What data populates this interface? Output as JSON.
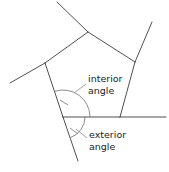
{
  "diagram": {
    "type": "geometry-figure",
    "background_color": "#ffffff",
    "line_color": "#3b3b3b",
    "arc_color": "#6f6f6f",
    "text_color": "#1b1b1b",
    "labels": {
      "interior": {
        "line1": "interior",
        "line2": "angle"
      },
      "exterior": {
        "line1": "exterior",
        "line2": "angle"
      }
    },
    "vertices": {
      "top": [
        88,
        32
      ],
      "upper_left": [
        45,
        63
      ],
      "upper_right": [
        135,
        62
      ],
      "lower_left": [
        63,
        117
      ],
      "lower_right": [
        120,
        117
      ]
    },
    "edges": [
      {
        "name": "top-left-edge",
        "from": [
          45,
          63
        ],
        "to": [
          88,
          32
        ]
      },
      {
        "name": "top-right-edge",
        "from": [
          88,
          32
        ],
        "to": [
          135,
          62
        ]
      },
      {
        "name": "right-edge",
        "from": [
          135,
          62
        ],
        "to": [
          120,
          117
        ]
      },
      {
        "name": "bottom-edge",
        "from": [
          120,
          117
        ],
        "to": [
          63,
          117
        ]
      },
      {
        "name": "left-edge",
        "from": [
          63,
          117
        ],
        "to": [
          45,
          63
        ]
      }
    ],
    "extensions": [
      {
        "name": "top-left-ray",
        "from": [
          88,
          32
        ],
        "to": [
          57,
          2
        ]
      },
      {
        "name": "upper-left-ray",
        "from": [
          45,
          63
        ],
        "to": [
          10,
          83
        ]
      },
      {
        "name": "upper-right-ray",
        "from": [
          135,
          62
        ],
        "to": [
          152,
          22
        ]
      },
      {
        "name": "base-ray",
        "from": [
          120,
          117
        ],
        "to": [
          166,
          117
        ]
      },
      {
        "name": "left-edge-ray",
        "from": [
          63,
          117
        ],
        "to": [
          78,
          161
        ]
      }
    ],
    "arcs": [
      {
        "name": "interior-angle-arc",
        "center": [
          63,
          117
        ],
        "radius": 27,
        "start_deg": 0,
        "end_deg": 108
      },
      {
        "name": "exterior-angle-arc",
        "center": [
          63,
          117
        ],
        "radius": 22,
        "start_deg": 288,
        "end_deg": 360
      }
    ],
    "tick_marks": [
      {
        "name": "interior-tick",
        "from": [
          60,
          100
        ],
        "to": [
          68,
          105
        ]
      },
      {
        "name": "exterior-tick",
        "from": [
          70,
          128
        ],
        "to": [
          78,
          134
        ]
      }
    ]
  }
}
